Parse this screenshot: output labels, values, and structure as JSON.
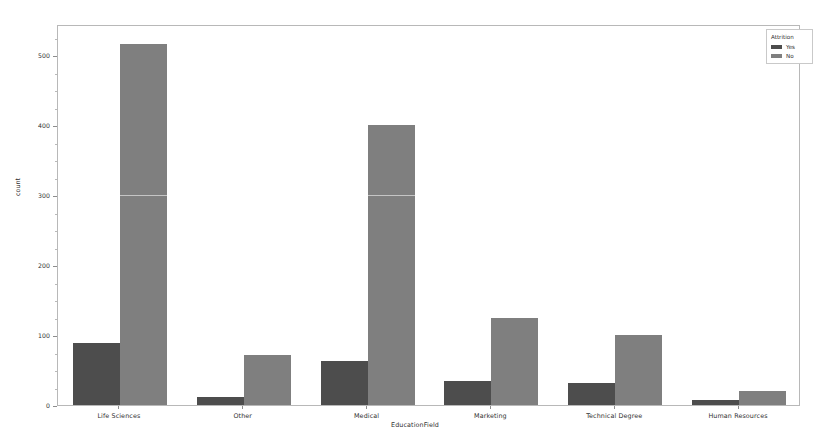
{
  "chart_data": {
    "type": "bar",
    "title": "",
    "subtitle": "",
    "xlabel": "EducationField",
    "ylabel": "count",
    "categories": [
      "Life Sciences",
      "Other",
      "Medical",
      "Marketing",
      "Technical Degree",
      "Human Resources"
    ],
    "series": [
      {
        "name": "Yes",
        "color": "#4d4d4d",
        "values": [
          89,
          11,
          63,
          35,
          32,
          7
        ]
      },
      {
        "name": "No",
        "color": "#7f7f7f",
        "values": [
          517,
          71,
          401,
          124,
          100,
          20
        ]
      }
    ],
    "legend": {
      "title": "Attrition",
      "position": "upper right",
      "entries": [
        "Yes",
        "No"
      ]
    },
    "ylim": [
      0,
      545
    ],
    "yticks": [
      0,
      100,
      200,
      300,
      400,
      500
    ],
    "ytick_labels": [
      "0",
      "100",
      "200",
      "300",
      "400",
      "500"
    ],
    "yminor_step": 25,
    "grid": false,
    "bar_group_mode": "grouped",
    "axis_frame_color": "#b8b8b8",
    "background": "#ffffff"
  }
}
